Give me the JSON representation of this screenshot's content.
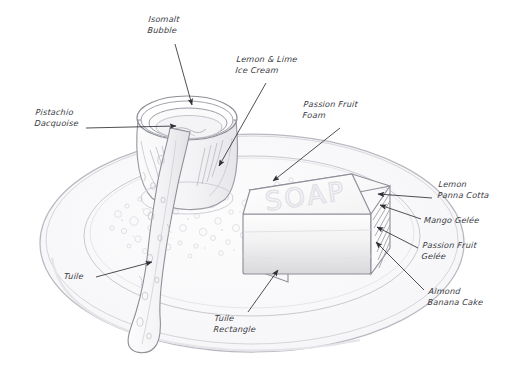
{
  "figure": {
    "type": "hand-drawn-sketch",
    "background_color": "#ffffff",
    "ink_color": "#6f7178",
    "label_color": "#3a3a42",
    "embossed_text": "SOAP"
  },
  "annotations": [
    {
      "id": "isomalt-bubble",
      "label": "Isomalt\nBubble",
      "label_x": 148,
      "label_y": 14,
      "align": "left",
      "arrow": {
        "x1": 175,
        "y1": 44,
        "x2": 192,
        "y2": 105
      }
    },
    {
      "id": "lemon-lime-ice-cream",
      "label": "Lemon & Lime\nIce Cream",
      "label_x": 236,
      "label_y": 54,
      "align": "left",
      "arrow": {
        "x1": 266,
        "y1": 83,
        "x2": 219,
        "y2": 166
      }
    },
    {
      "id": "pistachio-dacquoise",
      "label": "Pistachio\nDacquoise",
      "label_x": 35,
      "label_y": 107,
      "align": "left",
      "arrow": {
        "x1": 86,
        "y1": 128,
        "x2": 176,
        "y2": 126
      }
    },
    {
      "id": "passion-fruit-foam",
      "label": "Passion Fruit\nFoam",
      "label_x": 303,
      "label_y": 99,
      "align": "left",
      "arrow": {
        "x1": 340,
        "y1": 128,
        "x2": 273,
        "y2": 181
      }
    },
    {
      "id": "lemon-panna-cotta",
      "label": "Lemon\nPanna Cotta",
      "label_x": 438,
      "label_y": 179,
      "align": "left",
      "arrow": {
        "x1": 432,
        "y1": 198,
        "x2": 378,
        "y2": 194
      }
    },
    {
      "id": "mango-gelee",
      "label": "Mango Gelée",
      "label_x": 424,
      "label_y": 215,
      "align": "left",
      "arrow": {
        "x1": 421,
        "y1": 219,
        "x2": 380,
        "y2": 205
      }
    },
    {
      "id": "passion-fruit-gelee",
      "label": "Passion Fruit\nGelée",
      "label_x": 422,
      "label_y": 240,
      "align": "left",
      "arrow": {
        "x1": 418,
        "y1": 248,
        "x2": 377,
        "y2": 227
      }
    },
    {
      "id": "almond-banana-cake",
      "label": "Almond\nBanana Cake",
      "label_x": 428,
      "label_y": 286,
      "align": "left",
      "arrow": {
        "x1": 424,
        "y1": 290,
        "x2": 376,
        "y2": 242
      }
    },
    {
      "id": "tuile",
      "label": "Tuile",
      "label_x": 64,
      "label_y": 271,
      "align": "left",
      "arrow": {
        "x1": 96,
        "y1": 277,
        "x2": 152,
        "y2": 262
      }
    },
    {
      "id": "tuile-rectangle",
      "label": "Tuile\nRectangle",
      "label_x": 214,
      "label_y": 313,
      "align": "left",
      "arrow": {
        "x1": 248,
        "y1": 312,
        "x2": 278,
        "y2": 270
      }
    }
  ]
}
